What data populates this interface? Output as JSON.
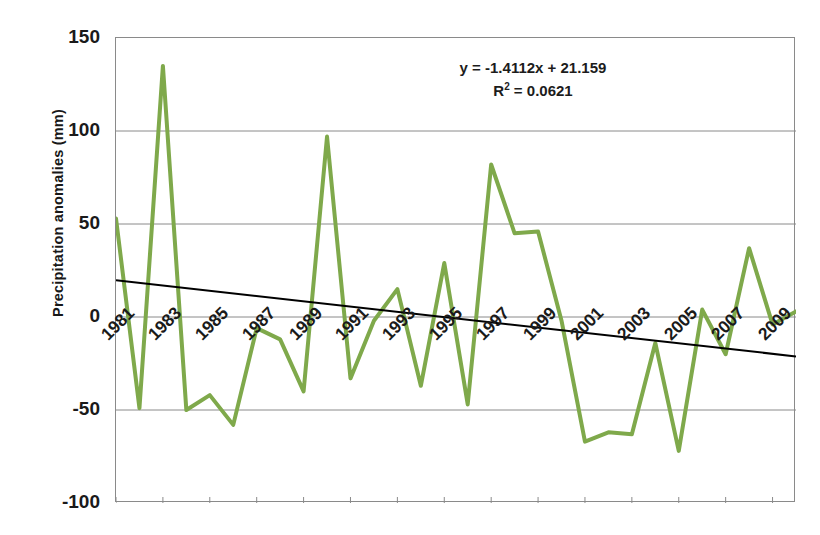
{
  "chart_data": {
    "type": "line",
    "title": "",
    "xlabel": "",
    "ylabel": "Precipitation anomalies  (mm)",
    "ylim": [
      -100,
      150
    ],
    "yticks": [
      150,
      100,
      50,
      0,
      -50,
      -100
    ],
    "ytick_labels": [
      "150",
      "100",
      "50",
      "0",
      "-50",
      "-100"
    ],
    "xlim": [
      1981,
      2010
    ],
    "xticks": [
      1981,
      1983,
      1985,
      1987,
      1989,
      1991,
      1993,
      1995,
      1997,
      1999,
      2001,
      2003,
      2005,
      2007,
      2009
    ],
    "xtick_labels": [
      "1981",
      "1983",
      "1985",
      "1987",
      "1989",
      "1991",
      "1993",
      "1995",
      "1997",
      "1999",
      "2001",
      "2003",
      "2005",
      "2007",
      "2009"
    ],
    "grid": true,
    "grid_axis": "y",
    "legend": false,
    "series": [
      {
        "name": "Precipitation anomalies",
        "color": "#7FA94B",
        "line_width": 4,
        "x": [
          1981,
          1982,
          1983,
          1984,
          1985,
          1986,
          1987,
          1988,
          1989,
          1990,
          1991,
          1992,
          1993,
          1994,
          1995,
          1996,
          1997,
          1998,
          1999,
          2000,
          2001,
          2002,
          2003,
          2004,
          2005,
          2006,
          2007,
          2008,
          2009,
          2010
        ],
        "values": [
          53,
          -49,
          135,
          -50,
          -42,
          -58,
          -6,
          -12,
          -40,
          97,
          -33,
          -2,
          15,
          -37,
          29,
          -47,
          82,
          45,
          46,
          -2,
          -67,
          -62,
          -63,
          -14,
          -72,
          4,
          -20,
          37,
          -4,
          3
        ]
      }
    ],
    "trendline": {
      "name": "Linear trend",
      "color": "#000000",
      "line_width": 2,
      "equation": "y = -1.4112x + 21.159",
      "slope": -1.4112,
      "intercept": 21.159,
      "r_squared_label": "R² = 0.0621",
      "r_squared": 0.0621,
      "x_start": 1981,
      "x_end": 2010,
      "y_start": 19.7,
      "y_end": -21.2
    },
    "annotations": [
      {
        "text": "y = -1.4112x + 21.159"
      },
      {
        "text": "R² = 0.0621"
      }
    ]
  },
  "axis": {
    "y_title": "Precipitation anomalies  (mm)"
  },
  "equation": {
    "line1": "y = -1.4112x + 21.159",
    "r2_prefix": "R",
    "r2_sup": "2",
    "r2_value": " = 0.0621"
  }
}
